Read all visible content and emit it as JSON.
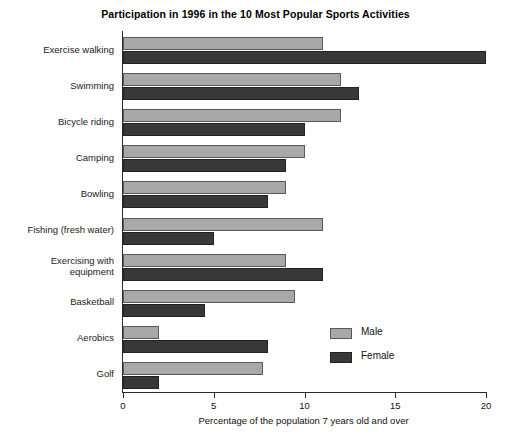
{
  "chart_data": {
    "type": "bar",
    "orientation": "horizontal",
    "title": "Participation in 1996 in the 10 Most Popular Sports Activities",
    "xlabel": "Percentage of the population 7 years old and over",
    "ylabel": "",
    "xlim": [
      0,
      20
    ],
    "xticks": [
      0,
      5,
      10,
      15,
      20
    ],
    "xtick_labels": [
      "0",
      "5",
      "10",
      "15",
      "20"
    ],
    "grid": false,
    "legend_position": "inside-lower-right",
    "categories": [
      "Exercise walking",
      "Swimming",
      "Bicycle riding",
      "Camping",
      "Bowling",
      "Fishing (fresh water)",
      "Exercising with equipment",
      "Basketball",
      "Aerobics",
      "Golf"
    ],
    "category_lines": [
      [
        "Exercise walking"
      ],
      [
        "Swimming"
      ],
      [
        "Bicycle riding"
      ],
      [
        "Camping"
      ],
      [
        "Bowling"
      ],
      [
        "Fishing (fresh water)"
      ],
      [
        "Exercising with",
        "equipment"
      ],
      [
        "Basketball"
      ],
      [
        "Aerobics"
      ],
      [
        "Golf"
      ]
    ],
    "series": [
      {
        "name": "Male",
        "color": "#a8a8a8",
        "values": [
          11.0,
          12.0,
          12.0,
          10.0,
          9.0,
          11.0,
          9.0,
          9.5,
          2.0,
          7.7
        ]
      },
      {
        "name": "Female",
        "color": "#383838",
        "values": [
          20.0,
          13.0,
          10.0,
          9.0,
          8.0,
          5.0,
          11.0,
          4.5,
          8.0,
          2.0
        ]
      }
    ]
  },
  "legend": {
    "items": [
      {
        "label": "Male",
        "color": "#a8a8a8"
      },
      {
        "label": "Female",
        "color": "#383838"
      }
    ]
  }
}
